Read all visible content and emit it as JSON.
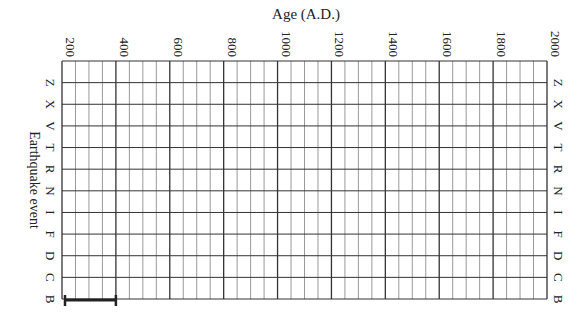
{
  "chart_data": {
    "type": "table",
    "title": "",
    "xlabel": "Age (A.D.)",
    "ylabel": "Earthquake event",
    "x_ticks": [
      200,
      400,
      600,
      800,
      1000,
      1200,
      1400,
      1600,
      1800,
      2000
    ],
    "x_minor_step": 50,
    "xlim": [
      200,
      2000
    ],
    "categories": [
      "Z",
      "X",
      "V",
      "T",
      "R",
      "N",
      "I",
      "F",
      "D",
      "C",
      "B"
    ],
    "grid": true,
    "series": [
      {
        "name": "B",
        "type": "range",
        "start": 200,
        "end": 400
      }
    ]
  },
  "colors": {
    "major_grid": "#333333",
    "minor_grid": "#9a9a9a",
    "bar": "#222222",
    "text": "#222222"
  }
}
